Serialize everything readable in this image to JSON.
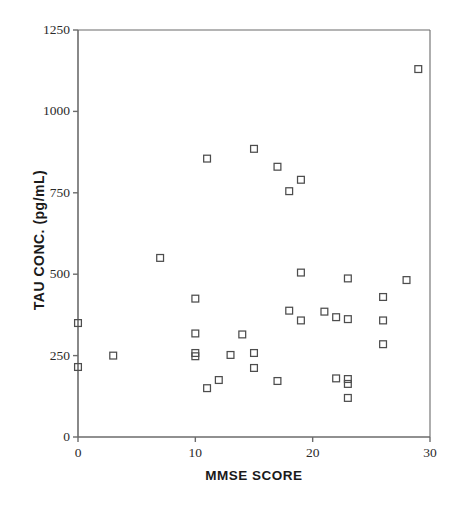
{
  "chart_data": {
    "type": "scatter",
    "title": "",
    "xlabel": "MMSE SCORE",
    "ylabel": "TAU  CONC.  (pg/mL)",
    "xlim": [
      0,
      30
    ],
    "ylim": [
      0,
      1250
    ],
    "xticks": [
      0,
      10,
      20,
      30
    ],
    "yticks": [
      0,
      250,
      500,
      750,
      1000,
      1250
    ],
    "xtick_labels": [
      "0",
      "10",
      "20",
      "30"
    ],
    "ytick_labels": [
      "0",
      "250",
      "500",
      "750",
      "1000",
      "1250"
    ],
    "grid": false,
    "legend": null,
    "marker": "open-square",
    "marker_color": "#4d4d4d",
    "series": [
      {
        "name": "patients",
        "points": [
          [
            0,
            350
          ],
          [
            0,
            215
          ],
          [
            3,
            250
          ],
          [
            7,
            550
          ],
          [
            10,
            425
          ],
          [
            10,
            318
          ],
          [
            10,
            258
          ],
          [
            10,
            248
          ],
          [
            11,
            855
          ],
          [
            11,
            150
          ],
          [
            12,
            175
          ],
          [
            13,
            252
          ],
          [
            14,
            315
          ],
          [
            15,
            885
          ],
          [
            15,
            258
          ],
          [
            15,
            212
          ],
          [
            17,
            830
          ],
          [
            17,
            172
          ],
          [
            18,
            755
          ],
          [
            18,
            388
          ],
          [
            19,
            790
          ],
          [
            19,
            505
          ],
          [
            19,
            358
          ],
          [
            21,
            385
          ],
          [
            22,
            368
          ],
          [
            22,
            180
          ],
          [
            23,
            487
          ],
          [
            23,
            362
          ],
          [
            23,
            178
          ],
          [
            23,
            163
          ],
          [
            23,
            120
          ],
          [
            26,
            430
          ],
          [
            26,
            358
          ],
          [
            26,
            285
          ],
          [
            28,
            482
          ],
          [
            29,
            1130
          ]
        ]
      }
    ]
  },
  "axes": {
    "frame_color": "#6b6b6b",
    "background": "#ffffff"
  }
}
